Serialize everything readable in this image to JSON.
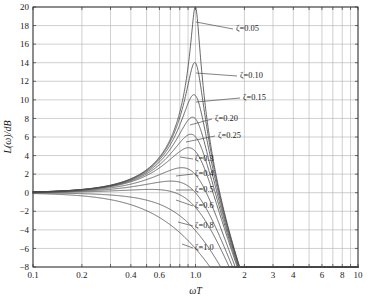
{
  "chart_data": {
    "type": "line",
    "title": "",
    "xlabel": "ωT",
    "ylabel": "L(ω)/dB",
    "xscale": "log",
    "xlim": [
      0.1,
      10
    ],
    "ylim": [
      -8,
      20
    ],
    "grid": true,
    "legend_position": "inline-annotations",
    "x_tick_labels": [
      "0.1",
      "0.2",
      "0.4",
      "0.6",
      "1.0",
      "2",
      "3",
      "4",
      "6",
      "8",
      "10"
    ],
    "x_tick_values": [
      0.1,
      0.2,
      0.4,
      0.6,
      1.0,
      2,
      3,
      4,
      6,
      8,
      10
    ],
    "x_gridlines": [
      0.1,
      0.2,
      0.3,
      0.4,
      0.5,
      0.6,
      0.7,
      0.8,
      0.9,
      1,
      2,
      3,
      4,
      5,
      6,
      7,
      8,
      9,
      10
    ],
    "y_tick_labels": [
      "20",
      "18",
      "16",
      "14",
      "12",
      "10",
      "8",
      "6",
      "4",
      "2",
      "0",
      "−2",
      "−4",
      "−6",
      "−8"
    ],
    "y_tick_values": [
      20,
      18,
      16,
      14,
      12,
      10,
      8,
      6,
      4,
      2,
      0,
      -2,
      -4,
      -6,
      -8
    ],
    "formula": "L = -20*log10( sqrt( (1-(wT)^2)^2 + (2*zeta*wT)^2 ) )",
    "series": [
      {
        "name": "ζ=0.05",
        "zeta": 0.05,
        "peak_db": 19.2,
        "peak_x": 1.0,
        "label": "ζ=0.05",
        "label_x": 236,
        "label_y": 31,
        "leader_from": [
          233,
          29
        ],
        "leader_to": [
          196,
          22
        ]
      },
      {
        "name": "ζ=0.10",
        "zeta": 0.1,
        "peak_db": 13.6,
        "peak_x": 1.0,
        "label": "ζ=0.10",
        "label_x": 240,
        "label_y": 78,
        "leader_from": [
          237,
          76
        ],
        "leader_to": [
          196,
          73
        ]
      },
      {
        "name": "ζ=0.15",
        "zeta": 0.15,
        "peak_db": 10.3,
        "peak_x": 0.99,
        "label": "ζ=0.15",
        "label_x": 243,
        "label_y": 100,
        "leader_from": [
          240,
          98
        ],
        "leader_to": [
          196,
          102
        ]
      },
      {
        "name": "ζ=0.20",
        "zeta": 0.2,
        "peak_db": 8.0,
        "peak_x": 0.98,
        "label": "ζ=0.20",
        "label_x": 215,
        "label_y": 121,
        "leader_from": [
          212,
          119
        ],
        "leader_to": [
          190,
          125
        ]
      },
      {
        "name": "ζ=0.25",
        "zeta": 0.25,
        "peak_db": 6.3,
        "peak_x": 0.97,
        "label": "ζ=0.25",
        "label_x": 218,
        "label_y": 138,
        "leader_from": [
          215,
          136
        ],
        "leader_to": [
          186,
          142
        ]
      },
      {
        "name": "ζ=0.3",
        "zeta": 0.3,
        "peak_db": 4.8,
        "peak_x": 0.95,
        "label": "ζ=0.3",
        "label_x": 195,
        "label_y": 161,
        "leader_from": [
          193,
          159
        ],
        "leader_to": [
          180,
          157
        ]
      },
      {
        "name": "ζ=0.4",
        "zeta": 0.4,
        "peak_db": 2.7,
        "peak_x": 0.91,
        "label": "ζ=0.4",
        "label_x": 195,
        "label_y": 176,
        "leader_from": [
          193,
          174
        ],
        "leader_to": [
          176,
          176
        ]
      },
      {
        "name": "ζ=0.5",
        "zeta": 0.5,
        "peak_db": 1.2,
        "peak_x": 0.84,
        "label": "ζ=0.5",
        "label_x": 195,
        "label_y": 192,
        "leader_from": [
          193,
          190
        ],
        "leader_to": [
          176,
          190
        ]
      },
      {
        "name": "ζ=0.6",
        "zeta": 0.6,
        "peak_db": 0.3,
        "peak_x": 0.72,
        "label": "ζ=0.6",
        "label_x": 195,
        "label_y": 208,
        "leader_from": [
          193,
          206
        ],
        "leader_to": [
          176,
          200
        ]
      },
      {
        "name": "ζ=0.8",
        "zeta": 0.8,
        "peak_db": -2.0,
        "peak_x": 1.0,
        "label": "ζ=0.8",
        "label_x": 195,
        "label_y": 228,
        "leader_from": [
          193,
          226
        ],
        "leader_to": [
          178,
          222
        ]
      },
      {
        "name": "ζ=1.0",
        "zeta": 1.0,
        "peak_db": -6.0,
        "peak_x": 1.0,
        "label": "ζ=1.0",
        "label_x": 195,
        "label_y": 250,
        "leader_from": [
          193,
          248
        ],
        "leader_to": [
          182,
          244
        ]
      }
    ],
    "colors": {
      "curve": "#4d4d4d",
      "grid": "#b0b0b0",
      "axis": "#333333",
      "background": "#ffffff",
      "text": "#1a1a1a"
    }
  },
  "plot_box": {
    "left": 33,
    "top": 7,
    "right": 358,
    "bottom": 267
  }
}
